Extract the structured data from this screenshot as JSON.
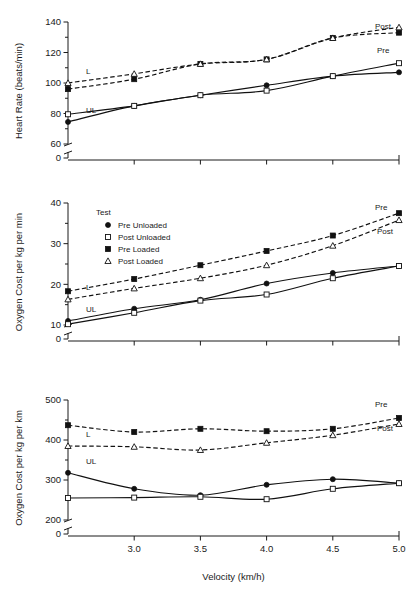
{
  "figure": {
    "xlabel": "Velocity (km/h)",
    "xticks": [
      "3.0",
      "3.5",
      "4.0",
      "4.5",
      "5.0"
    ],
    "x_values": [
      2.5,
      3.0,
      3.5,
      4.0,
      4.5,
      5.0
    ],
    "legend": {
      "title": "Test",
      "items": [
        {
          "label": "Pre Unloaded",
          "marker": "filled-circle",
          "line": "solid"
        },
        {
          "label": "Post Unloaded",
          "marker": "open-square",
          "line": "solid"
        },
        {
          "label": "Pre Loaded",
          "marker": "filled-square",
          "line": "dashed"
        },
        {
          "label": "Post Loaded",
          "marker": "open-triangle",
          "line": "dashed"
        }
      ]
    },
    "annotations": {
      "loaded": "L",
      "unloaded": "UL",
      "pre": "Pre",
      "post": "Post"
    },
    "colors": {
      "ink": "#111111",
      "axis": "#1a1a1a",
      "background": "#ffffff"
    }
  },
  "chart_data": [
    {
      "type": "line",
      "panel": 1,
      "title": "",
      "ylabel": "Heart Rate (beats/min)",
      "xlabel": "Velocity (km/h)",
      "x": [
        2.5,
        3.0,
        3.5,
        4.0,
        4.5,
        5.0
      ],
      "ylim": [
        0,
        140
      ],
      "yticks": [
        0,
        60,
        80,
        100,
        120,
        140
      ],
      "axis_break": true,
      "grid": false,
      "legend_position": "none",
      "right_labels": {
        "upper": "Post",
        "lower": "Pre"
      },
      "group_labels": {
        "upper": "L",
        "lower": "UL"
      },
      "series": [
        {
          "name": "Pre Unloaded",
          "marker": "filled-circle",
          "line": "solid",
          "values": [
            74.5,
            85.0,
            92.0,
            98.5,
            104.5,
            107.0
          ]
        },
        {
          "name": "Post Unloaded",
          "marker": "open-square",
          "line": "solid",
          "values": [
            79.5,
            85.0,
            92.0,
            95.0,
            104.5,
            113.0
          ]
        },
        {
          "name": "Pre Loaded",
          "marker": "filled-square",
          "line": "dashed",
          "values": [
            96.0,
            102.5,
            112.5,
            115.5,
            129.5,
            133.0
          ]
        },
        {
          "name": "Post Loaded",
          "marker": "open-triangle",
          "line": "dashed",
          "values": [
            100.0,
            106.0,
            112.5,
            115.5,
            129.5,
            136.5
          ]
        }
      ]
    },
    {
      "type": "line",
      "panel": 2,
      "title": "",
      "ylabel": "Oxygen Cost per kg per min",
      "xlabel": "Velocity (km/h)",
      "x": [
        2.5,
        3.0,
        3.5,
        4.0,
        4.5,
        5.0
      ],
      "ylim": [
        0,
        40
      ],
      "yticks": [
        0,
        10,
        20,
        30,
        40
      ],
      "axis_break": true,
      "grid": false,
      "legend_position": "upper-left",
      "right_labels": {
        "upper": "Pre",
        "lower": "Post"
      },
      "group_labels": {
        "upper": "L",
        "lower": "UL"
      },
      "series": [
        {
          "name": "Pre Unloaded",
          "marker": "filled-circle",
          "line": "solid",
          "values": [
            11.0,
            14.0,
            16.2,
            20.2,
            22.8,
            24.5
          ]
        },
        {
          "name": "Post Unloaded",
          "marker": "open-square",
          "line": "solid",
          "values": [
            10.2,
            13.0,
            16.0,
            17.5,
            21.5,
            24.5
          ]
        },
        {
          "name": "Pre Loaded",
          "marker": "filled-square",
          "line": "dashed",
          "values": [
            18.3,
            21.3,
            24.7,
            28.2,
            32.0,
            37.5
          ]
        },
        {
          "name": "Post Loaded",
          "marker": "open-triangle",
          "line": "dashed",
          "values": [
            16.3,
            19.0,
            21.5,
            24.7,
            29.5,
            35.8
          ]
        }
      ]
    },
    {
      "type": "line",
      "panel": 3,
      "title": "",
      "ylabel": "Oxygen Cost per kg per km",
      "xlabel": "Velocity (km/h)",
      "x": [
        2.5,
        3.0,
        3.5,
        4.0,
        4.5,
        5.0
      ],
      "ylim": [
        0,
        500
      ],
      "yticks": [
        0,
        200,
        300,
        400,
        500
      ],
      "axis_break": true,
      "grid": false,
      "legend_position": "none",
      "right_labels": {
        "upper": "Pre",
        "lower": "Post"
      },
      "group_labels": {
        "upper": "L",
        "lower": "UL"
      },
      "series": [
        {
          "name": "Pre Unloaded",
          "marker": "filled-circle",
          "line": "solid",
          "values": [
            318,
            278,
            262,
            288,
            302,
            292
          ]
        },
        {
          "name": "Post Unloaded",
          "marker": "open-square",
          "line": "solid",
          "values": [
            255,
            256,
            258,
            252,
            278,
            292
          ]
        },
        {
          "name": "Pre Loaded",
          "marker": "filled-square",
          "line": "dashed",
          "values": [
            437,
            420,
            428,
            422,
            428,
            455
          ]
        },
        {
          "name": "Post Loaded",
          "marker": "open-triangle",
          "line": "dashed",
          "values": [
            385,
            383,
            375,
            393,
            412,
            440
          ]
        }
      ]
    }
  ]
}
